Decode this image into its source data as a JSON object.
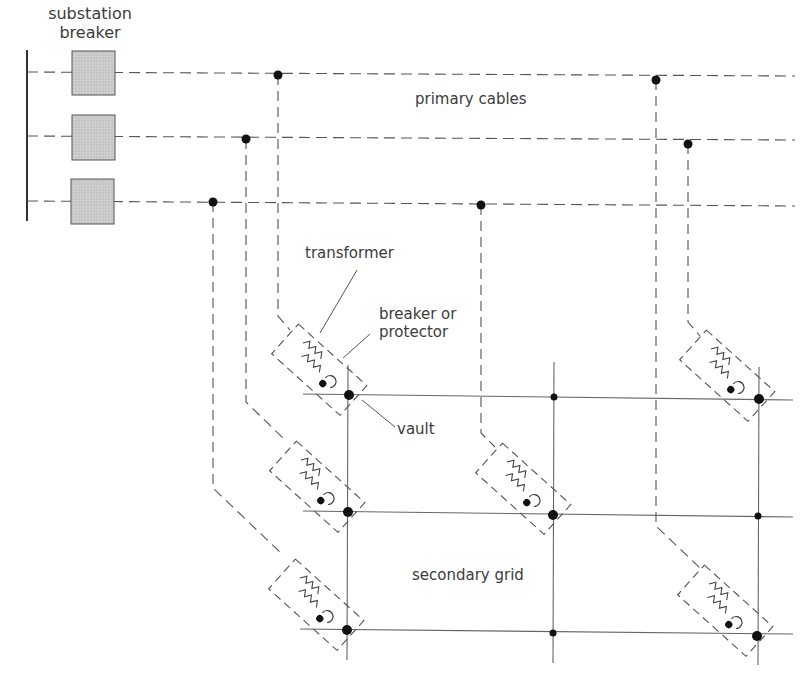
{
  "diagram": {
    "labels": {
      "substation_breaker_line1": "substation",
      "substation_breaker_line2": "breaker",
      "primary_cables": "primary cables",
      "transformer": "transformer",
      "breaker_or_protector_line1": "breaker or",
      "breaker_or_protector_line2": "protector",
      "vault": "vault",
      "secondary_grid": "secondary grid"
    },
    "nodes": {
      "bus": {
        "type": "substation-bus"
      },
      "breakers": [
        {
          "id": "breaker-1",
          "feeds": "primary-cable-1"
        },
        {
          "id": "breaker-2",
          "feeds": "primary-cable-2"
        },
        {
          "id": "breaker-3",
          "feeds": "primary-cable-3"
        }
      ],
      "primary_cables": [
        "primary-cable-1",
        "primary-cable-2",
        "primary-cable-3"
      ],
      "vaults": [
        {
          "id": "vault-1",
          "fed_by": "primary-cable-1",
          "grid_node": "row1-col1"
        },
        {
          "id": "vault-2",
          "fed_by": "primary-cable-2",
          "grid_node": "row2-col1"
        },
        {
          "id": "vault-3",
          "fed_by": "primary-cable-3",
          "grid_node": "row3-col1"
        },
        {
          "id": "vault-4",
          "fed_by": "primary-cable-3",
          "grid_node": "row2-col2"
        },
        {
          "id": "vault-5",
          "fed_by": "primary-cable-2",
          "grid_node": "row1-col3"
        },
        {
          "id": "vault-6",
          "fed_by": "primary-cable-1",
          "grid_node": "row3-col3"
        }
      ],
      "secondary_grid": {
        "rows": 3,
        "columns": 3
      }
    },
    "legend": {
      "primary_line_style": "dashed",
      "secondary_line_style": "solid",
      "enclosure_style": "dashed"
    },
    "colors": {
      "line": "#555555",
      "node": "#111111",
      "breaker_fill": "#c8c8c8"
    }
  }
}
